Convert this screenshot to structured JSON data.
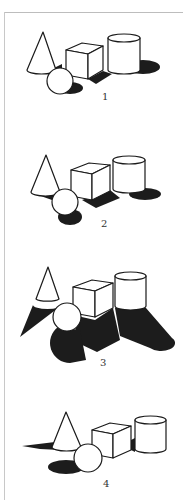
{
  "figure": {
    "panels": [
      {
        "label": "1",
        "shadow_description": "short soft shadows to right"
      },
      {
        "label": "2",
        "shadow_description": "shadows cast down-right"
      },
      {
        "label": "3",
        "shadow_description": "long dark shadows cast downward"
      },
      {
        "label": "4",
        "shadow_description": "shadows cast to left"
      }
    ]
  },
  "colors": {
    "shadow": "#1c1c1c",
    "outline": "#1a1a1a",
    "background": "#ffffff",
    "frame": "#bdbdbd"
  }
}
